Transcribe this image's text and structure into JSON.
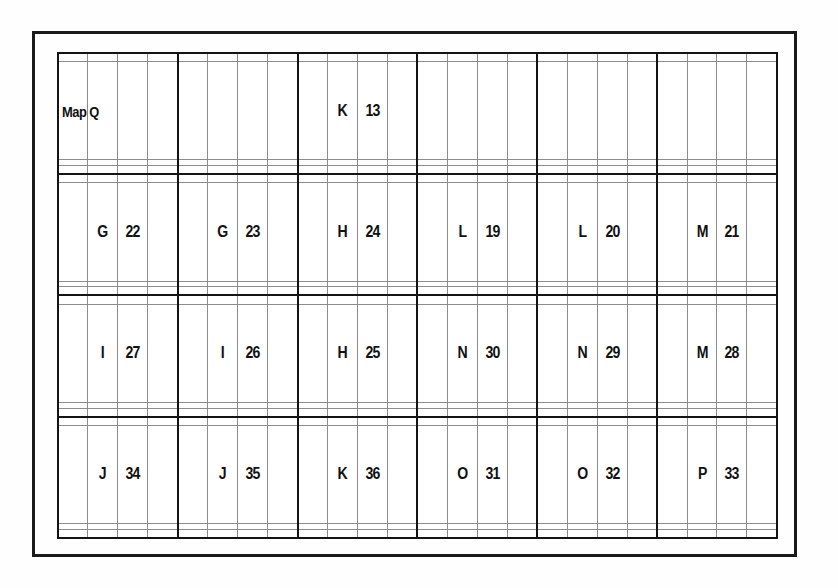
{
  "figure": {
    "title": "Map Q",
    "frame_color": "#1a1a1a",
    "major_line_color": "#141414",
    "minor_line_color": "#8d8d8d",
    "background": "#fefefe"
  },
  "grid": {
    "columns": 24,
    "rows": 16,
    "block_columns": 6,
    "block_rows": 4,
    "cells_per_block_x": 4,
    "cells_per_block_y": 4,
    "label_row_in_block": 2,
    "letter_col_in_block": 2,
    "number_col_in_block": 3
  },
  "zones": [
    {
      "block_row": 1,
      "block_col": 1,
      "letter": "",
      "number": ""
    },
    {
      "block_row": 1,
      "block_col": 2,
      "letter": "",
      "number": ""
    },
    {
      "block_row": 1,
      "block_col": 3,
      "letter": "K",
      "number": "13"
    },
    {
      "block_row": 1,
      "block_col": 4,
      "letter": "",
      "number": ""
    },
    {
      "block_row": 1,
      "block_col": 5,
      "letter": "",
      "number": ""
    },
    {
      "block_row": 1,
      "block_col": 6,
      "letter": "",
      "number": ""
    },
    {
      "block_row": 2,
      "block_col": 1,
      "letter": "G",
      "number": "22"
    },
    {
      "block_row": 2,
      "block_col": 2,
      "letter": "G",
      "number": "23"
    },
    {
      "block_row": 2,
      "block_col": 3,
      "letter": "H",
      "number": "24"
    },
    {
      "block_row": 2,
      "block_col": 4,
      "letter": "L",
      "number": "19"
    },
    {
      "block_row": 2,
      "block_col": 5,
      "letter": "L",
      "number": "20"
    },
    {
      "block_row": 2,
      "block_col": 6,
      "letter": "M",
      "number": "21"
    },
    {
      "block_row": 3,
      "block_col": 1,
      "letter": "I",
      "number": "27"
    },
    {
      "block_row": 3,
      "block_col": 2,
      "letter": "I",
      "number": "26"
    },
    {
      "block_row": 3,
      "block_col": 3,
      "letter": "H",
      "number": "25"
    },
    {
      "block_row": 3,
      "block_col": 4,
      "letter": "N",
      "number": "30"
    },
    {
      "block_row": 3,
      "block_col": 5,
      "letter": "N",
      "number": "29"
    },
    {
      "block_row": 3,
      "block_col": 6,
      "letter": "M",
      "number": "28"
    },
    {
      "block_row": 4,
      "block_col": 1,
      "letter": "J",
      "number": "34"
    },
    {
      "block_row": 4,
      "block_col": 2,
      "letter": "J",
      "number": "35"
    },
    {
      "block_row": 4,
      "block_col": 3,
      "letter": "K",
      "number": "36"
    },
    {
      "block_row": 4,
      "block_col": 4,
      "letter": "O",
      "number": "31"
    },
    {
      "block_row": 4,
      "block_col": 5,
      "letter": "O",
      "number": "32"
    },
    {
      "block_row": 4,
      "block_col": 6,
      "letter": "P",
      "number": "33"
    }
  ]
}
